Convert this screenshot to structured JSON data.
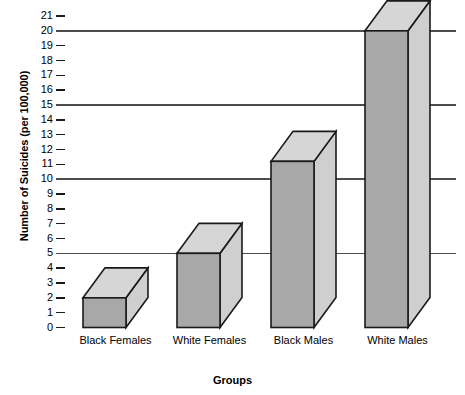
{
  "chart_data": {
    "type": "bar",
    "title": "",
    "subtitle": "",
    "xlabel": "Groups",
    "ylabel": "Number of Suicides (per 100,000)",
    "categories": [
      "Black Females",
      "White Females",
      "Black Males",
      "White Males"
    ],
    "values": [
      2,
      5,
      11.2,
      20
    ],
    "series": [
      {
        "name": "Number of Suicides (per 100,000)",
        "values": [
          2,
          5,
          11.2,
          20
        ]
      }
    ],
    "ylim": [
      0,
      21
    ],
    "yticks": [
      0,
      1,
      2,
      3,
      4,
      5,
      6,
      7,
      8,
      9,
      10,
      11,
      12,
      13,
      14,
      15,
      16,
      17,
      18,
      19,
      20,
      21
    ],
    "ytick_labels": [
      "0",
      "1",
      "2",
      "3",
      "4",
      "5",
      "6",
      "7",
      "8",
      "9",
      "10",
      "11",
      "12",
      "13",
      "14",
      "15",
      "16",
      "17",
      "18",
      "19",
      "20",
      "21"
    ],
    "gridlines_at": [
      5,
      10,
      15,
      20
    ],
    "grid": true,
    "legend": false,
    "legend_position": "none",
    "style": "3d-bars",
    "colors": {
      "bar_front": "#a8a8a8",
      "bar_top": "#d6d6d6",
      "bar_side": "#cfcfcf",
      "bar_outline": "#1a1a1a",
      "gridline": "#4d4d4d",
      "tick": "#1a1a1a",
      "text": "#000000",
      "background": "#ffffff"
    },
    "annotations": []
  }
}
